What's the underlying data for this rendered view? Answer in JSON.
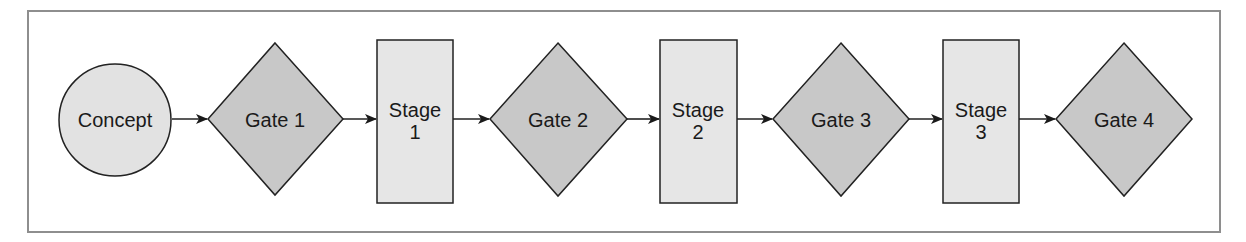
{
  "diagram": {
    "type": "stage-gate process flow",
    "colors": {
      "frame": "#8e8e8e",
      "stroke": "#222222",
      "concept_fill": "#e2e2e2",
      "gate_fill": "#c8c8c8",
      "stage_fill": "#e6e6e6",
      "text": "#1a1a1a"
    },
    "nodes": [
      {
        "id": "concept",
        "shape": "circle",
        "label": "Concept"
      },
      {
        "id": "gate1",
        "shape": "diamond",
        "label": "Gate 1"
      },
      {
        "id": "stage1",
        "shape": "rect",
        "label_line1": "Stage",
        "label_line2": "1"
      },
      {
        "id": "gate2",
        "shape": "diamond",
        "label": "Gate 2"
      },
      {
        "id": "stage2",
        "shape": "rect",
        "label_line1": "Stage",
        "label_line2": "2"
      },
      {
        "id": "gate3",
        "shape": "diamond",
        "label": "Gate 3"
      },
      {
        "id": "stage3",
        "shape": "rect",
        "label_line1": "Stage",
        "label_line2": "3"
      },
      {
        "id": "gate4",
        "shape": "diamond",
        "label": "Gate 4"
      }
    ],
    "edges": [
      {
        "from": "concept",
        "to": "gate1"
      },
      {
        "from": "gate1",
        "to": "stage1"
      },
      {
        "from": "stage1",
        "to": "gate2"
      },
      {
        "from": "gate2",
        "to": "stage2"
      },
      {
        "from": "stage2",
        "to": "gate3"
      },
      {
        "from": "gate3",
        "to": "stage3"
      },
      {
        "from": "stage3",
        "to": "gate4"
      }
    ]
  }
}
